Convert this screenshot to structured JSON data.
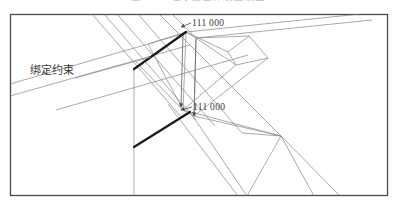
{
  "figure": {
    "caption_sliver": "图 4-12   轴承座整体装配模型",
    "frame": {
      "x": 10.5,
      "y": 14.5,
      "width": 377,
      "height": 181,
      "stroke": "#4a4a4a",
      "stroke_width": 1.3,
      "fill": "#ffffff"
    },
    "colors": {
      "mesh_line": "#8c8c94",
      "mesh_line_dark": "#6e6e78",
      "bold_constraint": "#1a1a1a",
      "leader": "#8c8c94",
      "text": "#3a3a3a",
      "frame": "#4a4a4a",
      "background": "#ffffff"
    }
  },
  "annotations": {
    "constraint_label": {
      "text": "绑定约束",
      "x": 30,
      "y": 74,
      "font_size": 11
    },
    "node_label_top": {
      "text": "111 000",
      "x": 192,
      "y": 26,
      "font_size": 9.5
    },
    "node_label_bottom": {
      "text": "111 000",
      "x": 193,
      "y": 110,
      "font_size": 9.5
    }
  },
  "geometry": {
    "bold_constraint_edges": [
      {
        "name": "upper-bonded-edge",
        "x1": 134,
        "y1": 69,
        "x2": 186,
        "y2": 32,
        "width": 2.2
      },
      {
        "name": "lower-bonded-edge",
        "x1": 134,
        "y1": 147,
        "x2": 190,
        "y2": 112,
        "width": 2.2
      }
    ],
    "leader_lines": [
      {
        "name": "constraint-leader",
        "x1": 75,
        "y1": 78,
        "x2": 151,
        "y2": 57
      },
      {
        "name": "top-node-leader",
        "x1": 191,
        "y1": 23,
        "x2": 181,
        "y2": 27
      },
      {
        "name": "bottom-node-leader",
        "x1": 192,
        "y1": 107,
        "x2": 181,
        "y2": 110
      }
    ],
    "vertical_arrows": [
      {
        "name": "left-vertical-arrow",
        "x1": 183,
        "y1": 34,
        "x2": 181,
        "y2": 107
      },
      {
        "name": "right-vertical-arrow",
        "x1": 196,
        "y1": 39,
        "x2": 194,
        "y2": 116
      }
    ],
    "mesh_lines": [
      {
        "x1": 92,
        "y1": 14,
        "x2": 182,
        "y2": 118
      },
      {
        "x1": 104,
        "y1": 14,
        "x2": 196,
        "y2": 120
      },
      {
        "x1": 117,
        "y1": 14,
        "x2": 215,
        "y2": 126
      },
      {
        "x1": 138,
        "y1": 14,
        "x2": 242,
        "y2": 133
      },
      {
        "x1": 10,
        "y1": 84,
        "x2": 186,
        "y2": 33
      },
      {
        "x1": 10,
        "y1": 96,
        "x2": 190,
        "y2": 45
      },
      {
        "x1": 56,
        "y1": 110,
        "x2": 248,
        "y2": 55
      },
      {
        "x1": 134,
        "y1": 69,
        "x2": 134,
        "y2": 196
      },
      {
        "x1": 186,
        "y1": 32,
        "x2": 183,
        "y2": 110
      },
      {
        "x1": 196,
        "y1": 38,
        "x2": 194,
        "y2": 116
      },
      {
        "x1": 186,
        "y1": 32,
        "x2": 196,
        "y2": 38
      },
      {
        "x1": 186,
        "y1": 32,
        "x2": 228,
        "y2": 52
      },
      {
        "x1": 196,
        "y1": 38,
        "x2": 249,
        "y2": 36
      },
      {
        "x1": 196,
        "y1": 38,
        "x2": 236,
        "y2": 65
      },
      {
        "x1": 228,
        "y1": 52,
        "x2": 249,
        "y2": 36
      },
      {
        "x1": 228,
        "y1": 52,
        "x2": 236,
        "y2": 65
      },
      {
        "x1": 249,
        "y1": 36,
        "x2": 268,
        "y2": 58
      },
      {
        "x1": 236,
        "y1": 65,
        "x2": 268,
        "y2": 58
      },
      {
        "x1": 183,
        "y1": 110,
        "x2": 236,
        "y2": 65
      },
      {
        "x1": 194,
        "y1": 116,
        "x2": 268,
        "y2": 58
      },
      {
        "x1": 183,
        "y1": 110,
        "x2": 194,
        "y2": 116
      },
      {
        "x1": 194,
        "y1": 116,
        "x2": 281,
        "y2": 136
      },
      {
        "x1": 183,
        "y1": 110,
        "x2": 281,
        "y2": 136
      },
      {
        "x1": 281,
        "y1": 136,
        "x2": 340,
        "y2": 196
      },
      {
        "x1": 281,
        "y1": 136,
        "x2": 314,
        "y2": 196
      },
      {
        "x1": 281,
        "y1": 136,
        "x2": 247,
        "y2": 196
      },
      {
        "x1": 242,
        "y1": 133,
        "x2": 281,
        "y2": 136
      },
      {
        "x1": 190,
        "y1": 112,
        "x2": 247,
        "y2": 196
      },
      {
        "x1": 168,
        "y1": 104,
        "x2": 238,
        "y2": 196
      },
      {
        "x1": 186,
        "y1": 32,
        "x2": 360,
        "y2": 14
      },
      {
        "x1": 196,
        "y1": 38,
        "x2": 372,
        "y2": 20
      },
      {
        "x1": 159,
        "y1": 14,
        "x2": 281,
        "y2": 136
      },
      {
        "x1": 172,
        "y1": 14,
        "x2": 196,
        "y2": 38
      },
      {
        "x1": 148,
        "y1": 44,
        "x2": 186,
        "y2": 32
      },
      {
        "x1": 148,
        "y1": 44,
        "x2": 183,
        "y2": 110
      },
      {
        "x1": 136,
        "y1": 62,
        "x2": 183,
        "y2": 110
      }
    ]
  }
}
